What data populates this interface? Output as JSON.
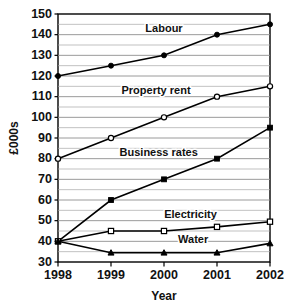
{
  "chart_data": {
    "type": "line",
    "title": "",
    "subtitle": "",
    "xlabel": "Year",
    "ylabel": "£000s",
    "categories": [
      "1998",
      "1999",
      "2000",
      "2001",
      "2002"
    ],
    "x": [
      1998,
      1999,
      2000,
      2001,
      2002
    ],
    "ylim": [
      30,
      150
    ],
    "ytick_labels": [
      "30",
      "40",
      "50",
      "60",
      "70",
      "80",
      "90",
      "100",
      "110",
      "120",
      "130",
      "140",
      "150"
    ],
    "ytick_values": [
      30,
      40,
      50,
      60,
      70,
      80,
      90,
      100,
      110,
      120,
      130,
      140,
      150
    ],
    "ytick_step": 10,
    "yminor_step": 5,
    "grid": "horizontal",
    "legend_position": "inline-labels",
    "series": [
      {
        "name": "Labour",
        "values": [
          120,
          125,
          130,
          140,
          145
        ],
        "marker": "filled-circle",
        "label_x": 2000.0,
        "label_y": 141.5
      },
      {
        "name": "Property rent",
        "values": [
          80,
          90,
          100,
          110,
          115
        ],
        "marker": "open-circle",
        "label_x": 1999.85,
        "label_y": 111.5
      },
      {
        "name": "Business rates",
        "values": [
          40,
          60,
          70,
          80,
          95
        ],
        "marker": "filled-square",
        "label_x": 1999.9,
        "label_y": 81.5
      },
      {
        "name": "Electricity",
        "values": [
          40,
          45,
          45,
          47,
          49.5
        ],
        "marker": "open-square",
        "label_x": 2000.5,
        "label_y": 51.5
      },
      {
        "name": "Water",
        "values": [
          40,
          34.5,
          34.5,
          34.5,
          39
        ],
        "marker": "filled-triangle",
        "label_x": 2000.55,
        "label_y": 39.2
      }
    ],
    "colors": {
      "line": "#000000",
      "grid_major": "#8e8e8e",
      "grid_minor": "#a8a8a8",
      "frame": "#000000",
      "background": "#ffffff",
      "text": "#111111"
    }
  }
}
